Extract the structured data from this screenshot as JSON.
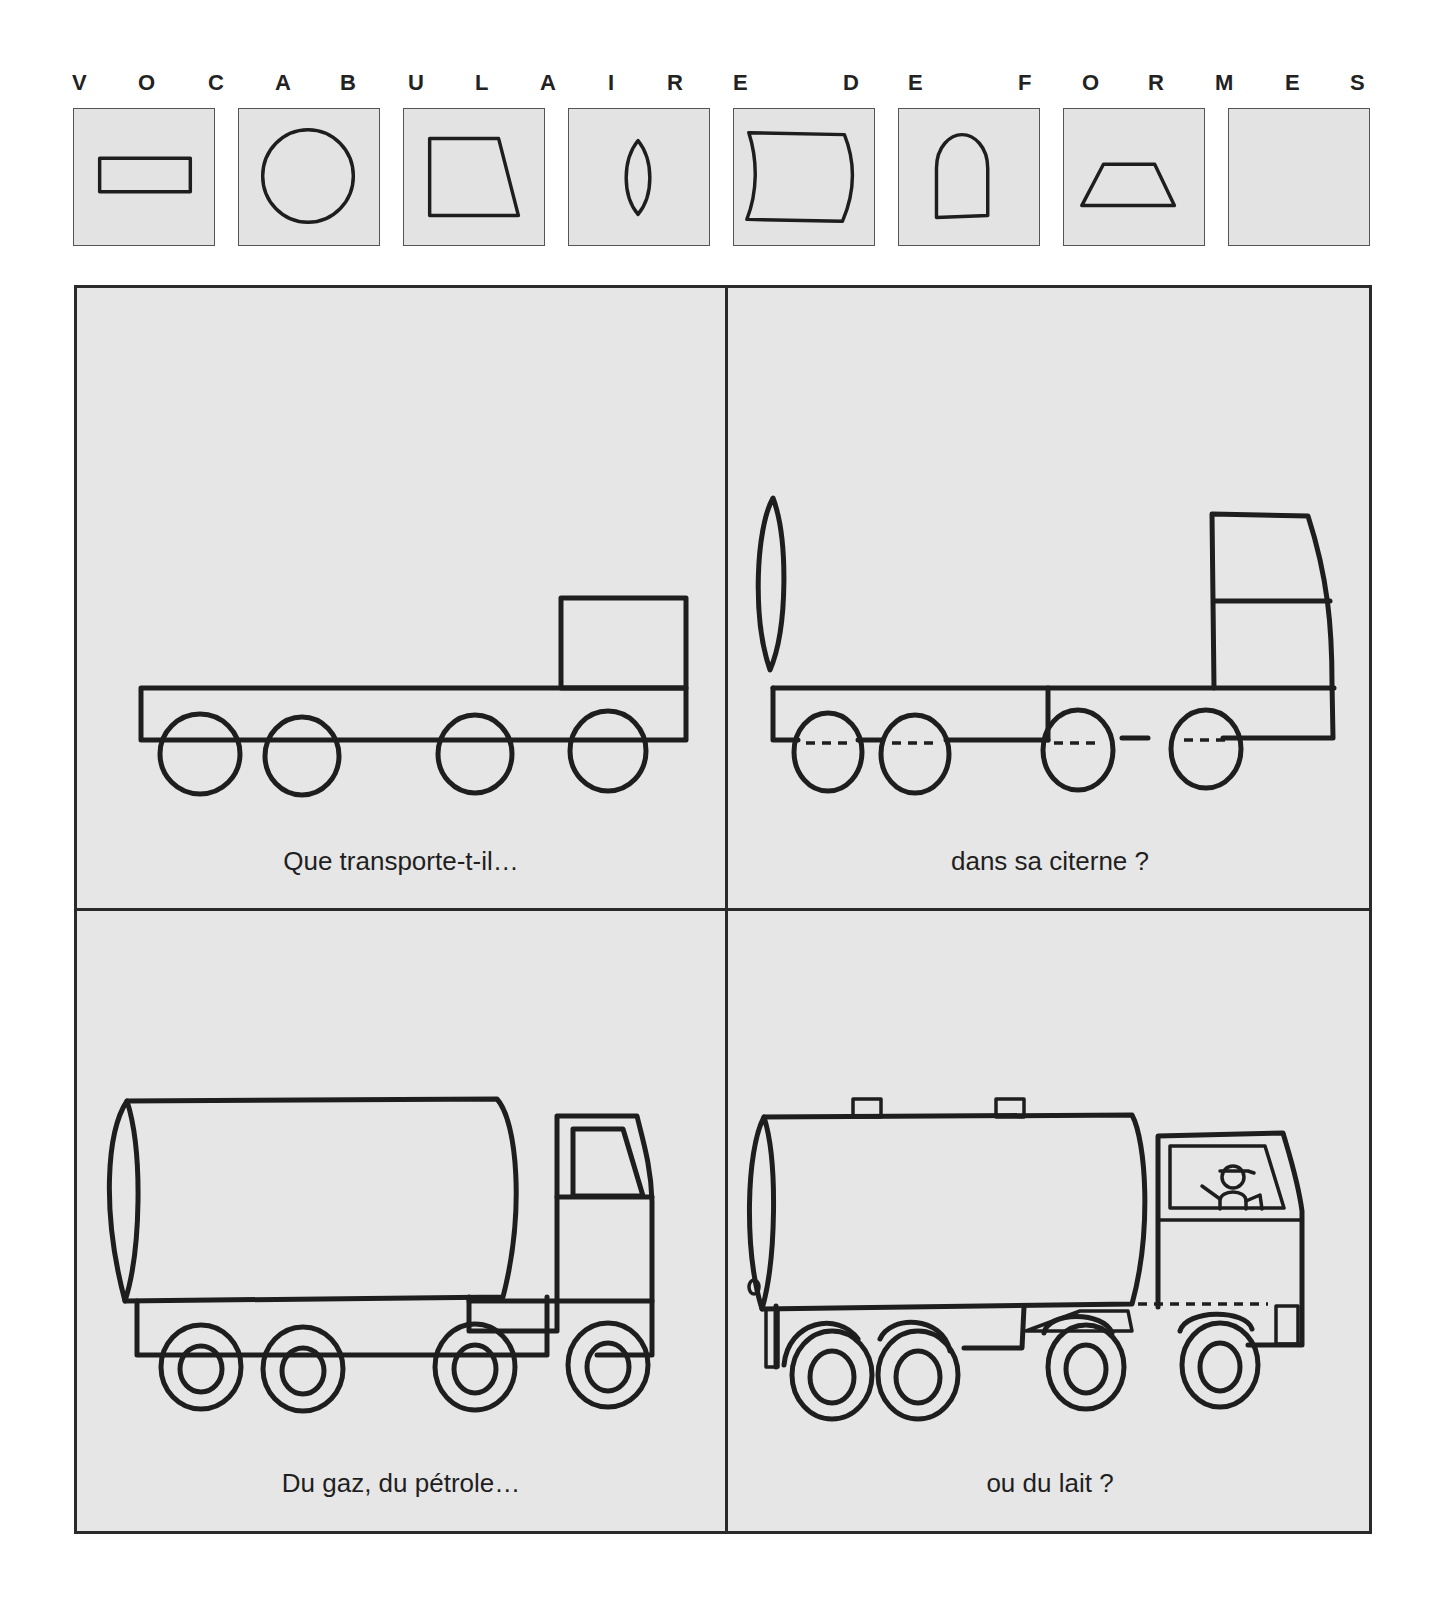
{
  "title": {
    "text": "VOCABULAIRE DE FORMES",
    "letters": [
      {
        "char": "V",
        "x": 2
      },
      {
        "char": "O",
        "x": 68
      },
      {
        "char": "C",
        "x": 138
      },
      {
        "char": "A",
        "x": 205
      },
      {
        "char": "B",
        "x": 270
      },
      {
        "char": "U",
        "x": 338
      },
      {
        "char": "L",
        "x": 405
      },
      {
        "char": "A",
        "x": 470
      },
      {
        "char": "I",
        "x": 538
      },
      {
        "char": "R",
        "x": 597
      },
      {
        "char": "E",
        "x": 663
      },
      {
        "char": "D",
        "x": 773
      },
      {
        "char": "E",
        "x": 838
      },
      {
        "char": "F",
        "x": 948
      },
      {
        "char": "O",
        "x": 1012
      },
      {
        "char": "R",
        "x": 1078
      },
      {
        "char": "M",
        "x": 1145
      },
      {
        "char": "E",
        "x": 1215
      },
      {
        "char": "S",
        "x": 1280
      }
    ]
  },
  "shape_vocabulary": [
    {
      "shape": "rectangle",
      "x": 73
    },
    {
      "shape": "circle",
      "x": 238
    },
    {
      "shape": "trapezoid-right-slant",
      "x": 403
    },
    {
      "shape": "lens",
      "x": 568
    },
    {
      "shape": "curved-rectangle",
      "x": 733
    },
    {
      "shape": "arch",
      "x": 898
    },
    {
      "shape": "trapezoid-isosceles",
      "x": 1063
    },
    {
      "shape": "empty",
      "x": 1228
    }
  ],
  "panels": [
    {
      "id": "step-1",
      "caption": "Que transporte-t-il…",
      "stage": "chassis with cab block and four wheels"
    },
    {
      "id": "step-2",
      "caption": "dans sa citerne ?",
      "stage": "tank end lens, cab outline, dashed axles"
    },
    {
      "id": "step-3",
      "caption": "Du gaz, du pétrole…",
      "stage": "cylindrical tank, windowed cab, double-ring wheels"
    },
    {
      "id": "step-4",
      "caption": "ou du lait ?",
      "stage": "finished tanker with hatches, driver and fenders"
    }
  ],
  "colors": {
    "panel_background": "#e6e6e6",
    "shape_box_background": "#e3e3e3",
    "line": "#1e1e1e"
  }
}
